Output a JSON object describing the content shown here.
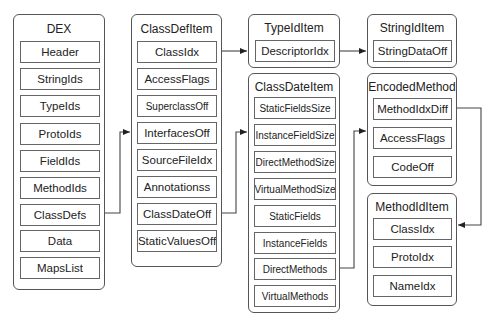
{
  "diagram": {
    "groups": {
      "dex": {
        "title": "DEX",
        "items": [
          "Header",
          "StringIds",
          "TypeIds",
          "ProtoIds",
          "FieldIds",
          "MethodIds",
          "ClassDefs",
          "Data",
          "MapsList"
        ]
      },
      "class_def_item": {
        "title": "ClassDefItem",
        "items": [
          "ClassIdx",
          "AccessFlags",
          "SuperclassOff",
          "InterfacesOff",
          "SourceFileIdx",
          "Annotationss",
          "ClassDateOff",
          "StaticValuesOff"
        ]
      },
      "type_id_item": {
        "title": "TypeIdItem",
        "items": [
          "DescriptorIdx"
        ]
      },
      "class_date_item": {
        "title": "ClassDateItem",
        "items": [
          "StaticFieldsSize",
          "InstanceFieldSize",
          "DirectMethodSize",
          "VirtualMethodSize",
          "StaticFields",
          "InstanceFields",
          "DirectMethods",
          "VirtualMethods"
        ]
      },
      "string_id_item": {
        "title": "StringIdItem",
        "items": [
          "StringDataOff"
        ]
      },
      "encoded_method": {
        "title": "EncodedMethod",
        "items": [
          "MethodIdxDiff",
          "AccessFlags",
          "CodeOff"
        ]
      },
      "method_id_item": {
        "title": "MethodIdItem",
        "items": [
          "ClassIdx",
          "ProtoIdx",
          "NameIdx"
        ]
      }
    },
    "edges": [
      {
        "from": "DEX.ClassDefs",
        "to": "ClassDefItem"
      },
      {
        "from": "ClassDefItem.ClassIdx",
        "to": "TypeIdItem"
      },
      {
        "from": "ClassDefItem.ClassDateOff",
        "to": "ClassDateItem"
      },
      {
        "from": "TypeIdItem.DescriptorIdx",
        "to": "StringIdItem"
      },
      {
        "from": "ClassDateItem.DirectMethods",
        "to": "EncodedMethod"
      },
      {
        "from": "EncodedMethod.MethodIdxDiff",
        "to": "MethodIdItem"
      }
    ],
    "colors": {
      "stroke": "#555555",
      "background": "#ffffff",
      "text": "#222222"
    }
  }
}
